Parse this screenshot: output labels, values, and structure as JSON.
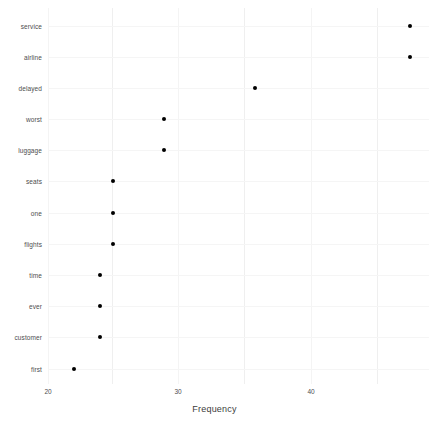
{
  "chart_data": {
    "type": "scatter",
    "title": "",
    "subtitle": "",
    "xlabel": "Frequency",
    "ylabel": "",
    "orientation": "horizontal-dotplot",
    "grid": true,
    "legend": null,
    "xlim": [
      19.0,
      48.5
    ],
    "xticks": [
      20,
      30,
      40
    ],
    "xtick_labels": [
      "20",
      "30",
      "40"
    ],
    "categories": [
      "service",
      "airline",
      "delayed",
      "worst",
      "luggage",
      "seats",
      "one",
      "flights",
      "time",
      "ever",
      "customer",
      "first"
    ],
    "values": [
      47,
      47,
      35,
      28,
      28,
      24,
      24,
      24,
      23,
      23,
      23,
      21
    ],
    "points": [
      {
        "category": "service",
        "value": 47
      },
      {
        "category": "airline",
        "value": 47
      },
      {
        "category": "delayed",
        "value": 35
      },
      {
        "category": "worst",
        "value": 28
      },
      {
        "category": "luggage",
        "value": 28
      },
      {
        "category": "seats",
        "value": 24
      },
      {
        "category": "one",
        "value": 24
      },
      {
        "category": "flights",
        "value": 24
      },
      {
        "category": "time",
        "value": 23
      },
      {
        "category": "ever",
        "value": 23
      },
      {
        "category": "customer",
        "value": 23
      },
      {
        "category": "first",
        "value": 21
      }
    ],
    "marker": {
      "shape": "circle",
      "color": "#000000",
      "size": 4
    },
    "colors": {
      "background": "#ffffff",
      "gridline": "#f2f2f2",
      "text": "#4d4d4d",
      "axis_title": "#3d3d3d",
      "marker": "#000000"
    }
  }
}
